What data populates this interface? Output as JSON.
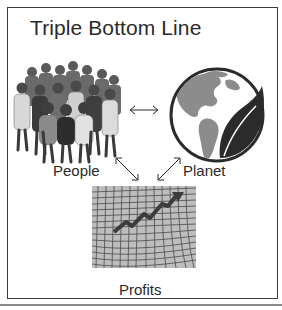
{
  "diagram": {
    "title": "Triple Bottom Line",
    "nodes": [
      {
        "id": "people",
        "label": "People",
        "icon": "group-of-people-icon"
      },
      {
        "id": "planet",
        "label": "Planet",
        "icon": "globe-with-leaf-icon"
      },
      {
        "id": "profits",
        "label": "Profits",
        "icon": "rising-chart-grid-icon"
      }
    ],
    "edges": [
      {
        "from": "people",
        "to": "planet",
        "type": "bidirectional"
      },
      {
        "from": "people",
        "to": "profits",
        "type": "bidirectional"
      },
      {
        "from": "planet",
        "to": "profits",
        "type": "bidirectional"
      }
    ],
    "colors": {
      "text": "#2a2a2a",
      "border": "#3c3c3c",
      "globe_land": "#8c8c8c",
      "globe_ocean": "#ffffff",
      "leaf": "#2b2b2b"
    }
  }
}
